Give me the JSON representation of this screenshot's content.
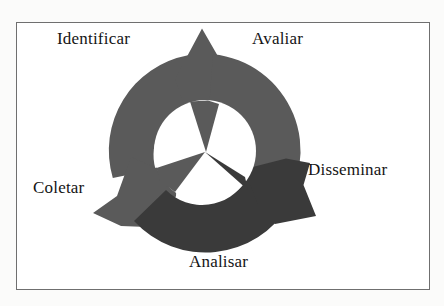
{
  "figure": {
    "type": "cyclical-process-diagram",
    "title": "",
    "border_color": "#6f6f6f",
    "background_color": "#ffffff",
    "page_background_color": "#fbfbfa",
    "text_color": "#141414"
  },
  "labels": {
    "identificar": "Identificar",
    "avaliar": "Avaliar",
    "disseminar": "Disseminar",
    "coletar": "Coletar",
    "analisar": "Analisar"
  },
  "cycle": {
    "direction": "clockwise",
    "stage_count": 5,
    "stages": [
      {
        "name": "Identificar",
        "position": "top-left"
      },
      {
        "name": "Avaliar",
        "position": "top-right"
      },
      {
        "name": "Disseminar",
        "position": "right"
      },
      {
        "name": "Analisar",
        "position": "bottom"
      },
      {
        "name": "Coletar",
        "position": "left"
      }
    ],
    "arrows": [
      {
        "name": "arrow-top",
        "head_position": "top",
        "fill": "#5a5a5a"
      },
      {
        "name": "arrow-lower-left",
        "head_position": "lower-left",
        "fill": "#5a5a5a"
      },
      {
        "name": "arrow-lower-right",
        "head_position": "lower-right",
        "fill": "#3a3a3a"
      }
    ],
    "ring": {
      "center_x": 205,
      "center_y": 151,
      "outer_radius": 97,
      "inner_radius": 51,
      "light_gray": "#5a5a5a",
      "dark_gray": "#3a3a3a",
      "hole_color": "#ffffff"
    }
  }
}
